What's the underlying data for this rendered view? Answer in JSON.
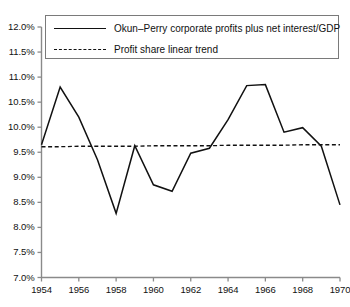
{
  "chart_data": {
    "type": "line",
    "title": "",
    "subtitle": "",
    "xlabel": "",
    "ylabel": "",
    "xlim": [
      1954,
      1970
    ],
    "ylim": [
      7.0,
      12.0
    ],
    "ytick_step": 0.5,
    "xtick_step": 2,
    "grid": false,
    "legend_position": "top-center",
    "x": [
      1954,
      1955,
      1956,
      1957,
      1958,
      1959,
      1960,
      1961,
      1962,
      1963,
      1964,
      1965,
      1966,
      1967,
      1968,
      1969,
      1970
    ],
    "series": [
      {
        "name": "Okun–Perry corporate profits plus net interest/GDP",
        "style": "solid",
        "color": "#111111",
        "values": [
          9.65,
          10.8,
          10.2,
          9.35,
          8.28,
          9.63,
          8.85,
          8.72,
          9.48,
          9.58,
          10.15,
          10.83,
          10.85,
          9.9,
          9.99,
          9.62,
          8.45
        ]
      },
      {
        "name": "Profit share linear trend",
        "style": "dashed",
        "color": "#111111",
        "values": [
          9.61,
          9.61,
          9.62,
          9.62,
          9.62,
          9.62,
          9.63,
          9.63,
          9.63,
          9.63,
          9.64,
          9.64,
          9.64,
          9.64,
          9.65,
          9.65,
          9.65
        ]
      }
    ],
    "ytick_labels": [
      "12.0%",
      "11.5%",
      "11.0%",
      "10.5%",
      "10.0%",
      "9.5%",
      "9.0%",
      "8.5%",
      "8.0%",
      "7.5%",
      "7.0%"
    ],
    "ytick_values": [
      12.0,
      11.5,
      11.0,
      10.5,
      10.0,
      9.5,
      9.0,
      8.5,
      8.0,
      7.5,
      7.0
    ],
    "xtick_labels": [
      "1954",
      "1956",
      "1958",
      "1960",
      "1962",
      "1964",
      "1966",
      "1968",
      "1970"
    ],
    "xtick_values": [
      1954,
      1956,
      1958,
      1960,
      1962,
      1964,
      1966,
      1968,
      1970
    ]
  },
  "legend": {
    "entries": [
      {
        "label": "Okun–Perry corporate profits plus net interest/GDP",
        "style": "solid"
      },
      {
        "label": "Profit share linear trend",
        "style": "dashed"
      }
    ]
  },
  "colors": {
    "series_line": "#111111",
    "trend_line": "#111111",
    "axis": "#8a8a8a",
    "text": "#111111",
    "background": "#ffffff",
    "legend_border": "#7a7a7a"
  }
}
